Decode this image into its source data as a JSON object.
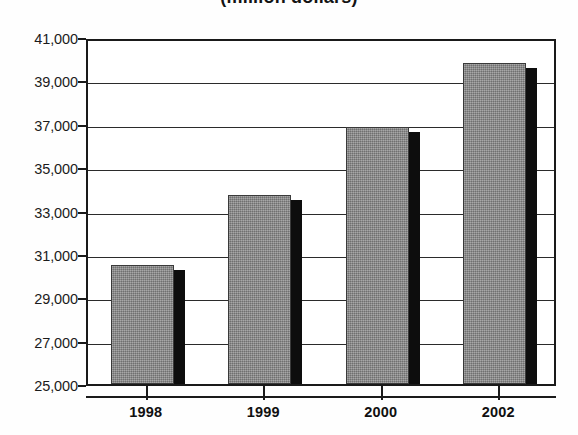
{
  "chart_data": {
    "type": "bar",
    "title": "(million dollars)",
    "subtitle": "",
    "xlabel": "",
    "ylabel": "",
    "categories": [
      "1998",
      "1999",
      "2000",
      "2002"
    ],
    "values": [
      30500,
      33700,
      36850,
      39800
    ],
    "series": [
      {
        "name": "",
        "values": [
          30500,
          33700,
          36850,
          39800
        ]
      }
    ],
    "ylim": [
      25000,
      41000
    ],
    "y_tick_values": [
      41000,
      39000,
      37000,
      35000,
      33000,
      31000,
      29000,
      27000,
      25000
    ],
    "y_tick_labels": [
      "41,000",
      "39,000",
      "37,000",
      "35,000",
      "33,000",
      "31,000",
      "29,000",
      "27,000",
      "25,000"
    ],
    "y_tick_step": 2000,
    "grid": true,
    "grid_axis": "y",
    "legend": false,
    "legend_position": "none",
    "bar_fill_color": "#8b8b8b",
    "bar_shadow_color": "#0d0d0d",
    "axis_color": "#1a1a1a",
    "background_color": "#ffffff",
    "annotations": []
  },
  "title": {
    "text": "(million dollars)"
  },
  "axes": {
    "y_labels": [
      "41,000",
      "39,000",
      "37,000",
      "35,000",
      "33,000",
      "31,000",
      "29,000",
      "27,000",
      "25,000"
    ],
    "x_labels": [
      "1998",
      "1999",
      "2000",
      "2002"
    ]
  }
}
